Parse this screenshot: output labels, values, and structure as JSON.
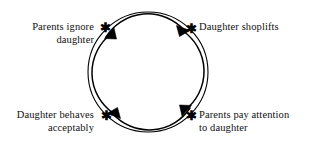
{
  "diagram": {
    "type": "causal-loop",
    "direction": "clockwise",
    "background_color": "#ffffff",
    "stroke_color": "#000000",
    "text_color": "#101010",
    "node_marker_glyph": "✱",
    "geometry": {
      "center_x": 148,
      "center_y": 72,
      "outer_radius": 60,
      "inner_radius": 49
    },
    "nodes": [
      {
        "id": "parents-ignore",
        "label": "Parents ignore\ndaughter",
        "position": "top-left",
        "marker": "✱"
      },
      {
        "id": "daughter-shoplifts",
        "label": "Daughter shoplifts",
        "position": "top-right",
        "marker": "✱"
      },
      {
        "id": "parents-attention",
        "label": "Parents pay attention\nto daughter",
        "position": "bottom-right",
        "marker": "✱"
      },
      {
        "id": "daughter-behaves",
        "label": "Daughter behaves\nacceptably",
        "position": "bottom-left",
        "marker": "✱"
      }
    ],
    "arrows": [
      {
        "id": "arrow-top",
        "from": "parents-ignore",
        "to": "daughter-shoplifts",
        "direction": "rightward-clockwise"
      },
      {
        "id": "arrow-right",
        "from": "daughter-shoplifts",
        "to": "parents-attention",
        "direction": "downward-clockwise"
      },
      {
        "id": "arrow-bottom",
        "from": "parents-attention",
        "to": "daughter-behaves",
        "direction": "leftward-clockwise"
      },
      {
        "id": "arrow-left",
        "from": "daughter-behaves",
        "to": "parents-ignore",
        "direction": "upward-clockwise"
      }
    ]
  }
}
